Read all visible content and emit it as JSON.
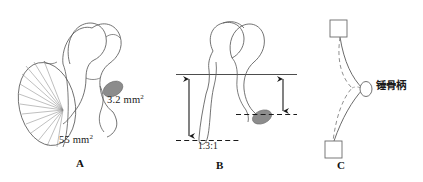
{
  "figure": {
    "background_color": "#ffffff",
    "line_color": "#555555",
    "text_color": "#1a1a1a",
    "fill_gray": "#8c8c8c"
  },
  "panels": [
    {
      "id": "A",
      "letter": "A",
      "name": "area-ratio-panel",
      "annotations": [
        {
          "id": "area-small",
          "text": "3.2 mm",
          "superscript": "2",
          "meaning": "stapes-footplate-area"
        },
        {
          "id": "area-large",
          "text": "55 mm",
          "superscript": "2",
          "meaning": "tympanic-membrane-area"
        }
      ]
    },
    {
      "id": "B",
      "letter": "B",
      "name": "lever-ratio-panel",
      "annotations": [
        {
          "id": "lever-ratio",
          "text": "1.3:1",
          "meaning": "malleus-to-incus-lever-ratio"
        }
      ]
    },
    {
      "id": "C",
      "letter": "C",
      "name": "buckling-panel",
      "annotations": [
        {
          "id": "manubrium",
          "text": "锤骨柄",
          "meaning": "manubrium-of-malleus"
        }
      ]
    }
  ],
  "labels": {
    "area_small": "3.2 mm",
    "area_small_sup": "2",
    "area_large": "55 mm",
    "area_large_sup": "2",
    "lever_ratio": "1.3:1",
    "manubrium_cjk": "锤骨柄",
    "panel_a": "A",
    "panel_b": "B",
    "panel_c": "C"
  }
}
